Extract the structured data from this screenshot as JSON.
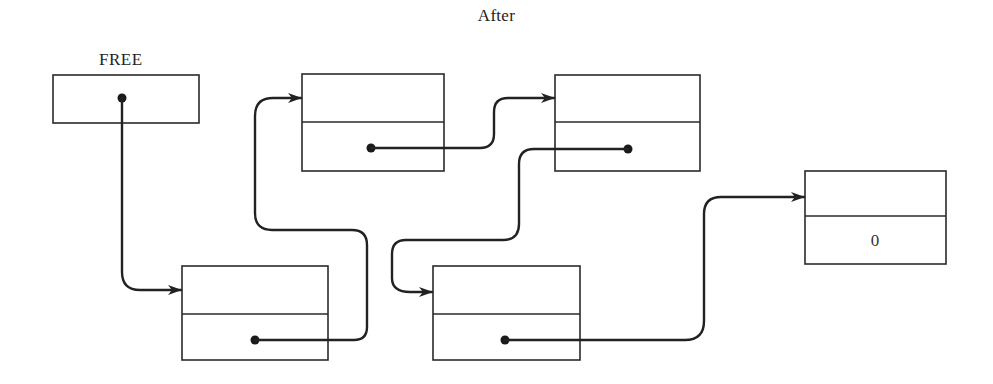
{
  "diagram": {
    "title": "After",
    "type": "linked-list-free-storage",
    "head_pointer": {
      "label": "FREE"
    },
    "nodes": [
      {
        "id": "node-1",
        "link_field": "pointer",
        "next": "node-2"
      },
      {
        "id": "node-2",
        "link_field": "pointer",
        "next": "node-3"
      },
      {
        "id": "node-3",
        "link_field": "pointer",
        "next": "node-4"
      },
      {
        "id": "node-4",
        "link_field": "pointer",
        "next": "node-5"
      },
      {
        "id": "node-5",
        "link_field": "0",
        "next": null
      }
    ],
    "terminal_value": "0"
  },
  "colors": {
    "line": "#222222",
    "background": "#ffffff"
  }
}
